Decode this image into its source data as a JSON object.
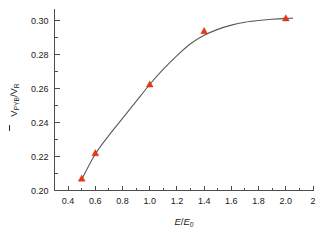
{
  "chart_data": {
    "type": "scatter",
    "title": "",
    "subtitle": "",
    "xlabel": "E/E0",
    "xlabel_parts": {
      "numerator": "E",
      "denominator": "E",
      "denominator_sub": "0"
    },
    "ylabel": "V̄PYB/VR",
    "ylabel_parts": {
      "main": "V",
      "main_sub": "PYB",
      "second": "V",
      "second_sub": "R",
      "overline": true
    },
    "xlim": [
      0.3,
      2.2
    ],
    "ylim": [
      0.2,
      0.307
    ],
    "grid": false,
    "legend": null,
    "x_ticks": [
      0.4,
      0.6,
      0.8,
      1.0,
      1.2,
      1.4,
      1.6,
      1.8,
      2.0,
      2.2
    ],
    "x_tick_labels": [
      "0.4",
      "0.6",
      "0.8",
      "1.0",
      "1.2",
      "1.4",
      "1.6",
      "1.8",
      "2.0",
      "2"
    ],
    "x_minor_ticks": [
      0.5,
      0.7,
      0.9,
      1.1,
      1.3,
      1.5,
      1.7,
      1.9,
      2.1
    ],
    "y_ticks": [
      0.2,
      0.22,
      0.24,
      0.26,
      0.28,
      0.3
    ],
    "y_tick_labels": [
      "0.20",
      "0.22",
      "0.24",
      "0.26",
      "0.28",
      "0.30"
    ],
    "y_minor_ticks": [
      0.21,
      0.23,
      0.25,
      0.27,
      0.29
    ],
    "series": [
      {
        "name": "measured",
        "marker": "triangle",
        "color": "#e8380d",
        "x": [
          0.5,
          0.6,
          1.0,
          1.4,
          2.0
        ],
        "y": [
          0.207,
          0.222,
          0.2625,
          0.294,
          0.3015
        ]
      },
      {
        "name": "fit-curve",
        "marker": "none",
        "color": "#5a5a5a",
        "x": [
          0.5,
          0.6,
          0.7,
          0.8,
          0.9,
          1.0,
          1.1,
          1.2,
          1.3,
          1.4,
          1.5,
          1.6,
          1.7,
          1.8,
          1.9,
          2.0,
          2.05
        ],
        "y": [
          0.2065,
          0.2215,
          0.2325,
          0.2425,
          0.2525,
          0.2625,
          0.2715,
          0.2795,
          0.2865,
          0.2915,
          0.295,
          0.2975,
          0.2992,
          0.3002,
          0.301,
          0.3015,
          0.3016
        ]
      }
    ],
    "colors": {
      "marker": "#e8380d",
      "curve": "#5a5a5a",
      "axis": "#4d4d4d",
      "text": "#1a1a1a",
      "background": "#ffffff"
    }
  }
}
